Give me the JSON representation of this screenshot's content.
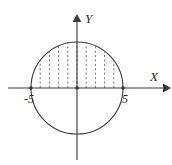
{
  "figure": {
    "title": ""
  },
  "chart_data": {
    "type": "diagram",
    "subtype": "geometry-circle-with-vertical-strips",
    "title": "",
    "xlabel": "X",
    "ylabel": "Y",
    "grid": false,
    "legend": null,
    "axes": {
      "x": {
        "label": "X",
        "arrow": "right",
        "pixel_y": 88,
        "pixel_x_start": 8,
        "pixel_x_end": 168,
        "tick_labels": [
          "-5",
          "5"
        ],
        "tick_values": [
          -5,
          5
        ]
      },
      "y": {
        "label": "Y",
        "arrow": "up",
        "pixel_x": 77,
        "pixel_y_start": 16,
        "pixel_y_end": 160,
        "tick_labels": [],
        "tick_values": []
      }
    },
    "shape": {
      "kind": "circle",
      "center": [
        0,
        0
      ],
      "radius": 5,
      "equation": "x^2 + y^2 = 25",
      "pixel_center": [
        77,
        88
      ],
      "pixel_radius": 46,
      "x_intercepts": [
        -5,
        5
      ],
      "stroke": "#3a3a3a"
    },
    "strips": {
      "style": "dashed",
      "orientation": "vertical",
      "region": "upper half disk",
      "count": 9,
      "x_values": [
        -4,
        -3,
        -2,
        -1,
        0,
        1,
        2,
        3,
        4
      ],
      "stroke": "#6b6b6b"
    },
    "annotations": [
      {
        "text": "-5",
        "x": -5,
        "y": 0,
        "position": "below-left"
      },
      {
        "text": "5",
        "x": 5,
        "y": 0,
        "position": "below-right"
      },
      {
        "text": "X",
        "x": 5.8,
        "y": 0.45,
        "position": "axis-end"
      },
      {
        "text": "Y",
        "x": 0.45,
        "y": 5.9,
        "position": "axis-end"
      }
    ],
    "colors": {
      "axis": "#3a3a3a",
      "curve": "#3a3a3a",
      "strips": "#6b6b6b",
      "text": "#2b2b2b",
      "background": "#ffffff"
    }
  },
  "labels": {
    "x_axis": "X",
    "y_axis": "Y",
    "left_intercept": "-5",
    "right_intercept": "5"
  }
}
